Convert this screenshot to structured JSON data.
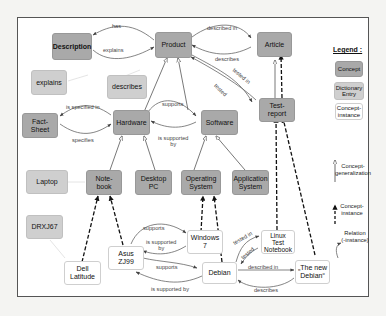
{
  "diagram": {
    "concepts": {
      "description": "Description",
      "product": "Product",
      "article": "Article",
      "fact_sheet": "Fact-\nSheet",
      "hardware": "Hardware",
      "software": "Software",
      "test_report": "Test-\nreport",
      "notebook": "Note-\nbook",
      "desktop_pc": "Desktop\nPC",
      "operating_system": "Operating\nSystem",
      "application_system": "Application\nSystem"
    },
    "dictionary_entries": {
      "explains": "explains",
      "describes": "describes",
      "laptop": "Laptop",
      "drxj67": "DRXJ67"
    },
    "instances": {
      "dell_latitude": "Dell\nLatitude",
      "asus_zj99": "Asus\nZJ99",
      "windows7": "Windows\n7",
      "debian": "Debian",
      "linux_test_notebook": "Linux\nTest\nNotebook",
      "the_new_debian": "„The new\nDebian“"
    },
    "edge_labels": {
      "has": "has",
      "explains": "explains",
      "described_in": "described in",
      "describes": "describes",
      "tested_in": "tested in",
      "tested": "tested",
      "is_specified_in": "is specified in",
      "specifies": "specifies",
      "supports": "supports",
      "is_supported_by_2l": "is supported\nby",
      "inst_supports_1": "supports",
      "inst_is_supported_by_1": "is supported\nby",
      "inst_supports_2": "supports",
      "inst_is_supported_by_2": "is supported by",
      "inst_tested_in": "tested in",
      "inst_tested": "tested",
      "inst_described_in": "described in",
      "inst_describes": "describes"
    },
    "legend": {
      "title": "Legend :",
      "concept": "Concept",
      "dictionary_entry": "Dictionary\nEntry",
      "concept_instance_box": "Concept-\ninstance",
      "concept_generalization": "Concept-\ngeneralization",
      "concept_instance_arrow": "Concept-\ninstance",
      "relation": "Relation\n(-instance)"
    },
    "colors": {
      "concept": "#a9a9a9",
      "dictionary_entry": "#cfcfcf",
      "instance": "#ffffff",
      "edge": "#555555"
    }
  }
}
